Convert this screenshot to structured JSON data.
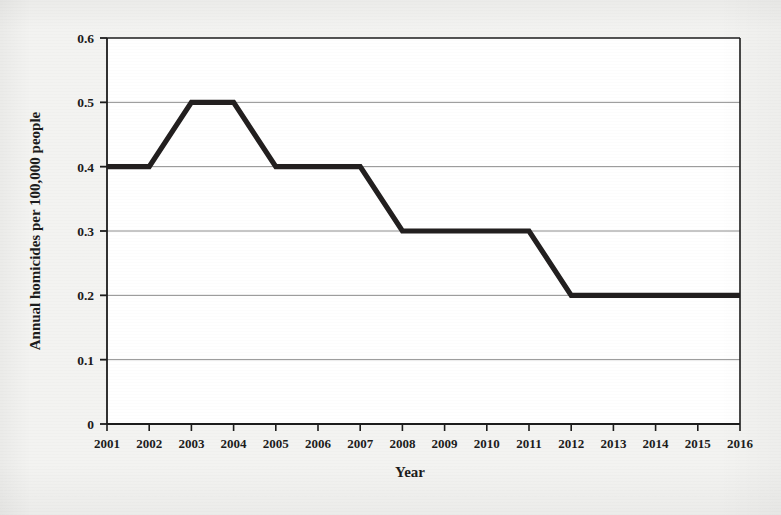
{
  "chart_data": {
    "type": "line",
    "title": "",
    "xlabel": "Year",
    "ylabel": "Annual homicides per 100,000 people",
    "categories": [
      "2001",
      "2002",
      "2003",
      "2004",
      "2005",
      "2006",
      "2007",
      "2008",
      "2009",
      "2010",
      "2011",
      "2012",
      "2013",
      "2014",
      "2015",
      "2016"
    ],
    "x": [
      2001,
      2002,
      2003,
      2004,
      2005,
      2006,
      2007,
      2008,
      2009,
      2010,
      2011,
      2012,
      2013,
      2014,
      2015,
      2016
    ],
    "values": [
      0.4,
      0.4,
      0.5,
      0.5,
      0.4,
      0.4,
      0.4,
      0.3,
      0.3,
      0.3,
      0.3,
      0.2,
      0.2,
      0.2,
      0.2,
      0.2
    ],
    "series": [
      {
        "name": "Annual homicides per 100,000 people",
        "values": [
          0.4,
          0.4,
          0.5,
          0.5,
          0.4,
          0.4,
          0.4,
          0.3,
          0.3,
          0.3,
          0.3,
          0.2,
          0.2,
          0.2,
          0.2,
          0.2
        ]
      }
    ],
    "ylim": [
      0,
      0.6
    ],
    "xlim": [
      2001,
      2016
    ],
    "yticks": [
      0,
      0.1,
      0.2,
      0.3,
      0.4,
      0.5,
      0.6
    ],
    "ytick_labels": [
      "0",
      "0.1",
      "0.2",
      "0.3",
      "0.4",
      "0.5",
      "0.6"
    ],
    "xtick_labels": [
      "2001",
      "2002",
      "2003",
      "2004",
      "2005",
      "2006",
      "2007",
      "2008",
      "2009",
      "2010",
      "2011",
      "2012",
      "2013",
      "2014",
      "2015",
      "2016"
    ],
    "grid": "horizontal",
    "legend": "none",
    "line_color": "#221f1f",
    "grid_color": "#8c8c8c",
    "axis_color": "#1c1c1c",
    "plot_background": "#ffffff",
    "page_background": "#f3f3f1"
  }
}
